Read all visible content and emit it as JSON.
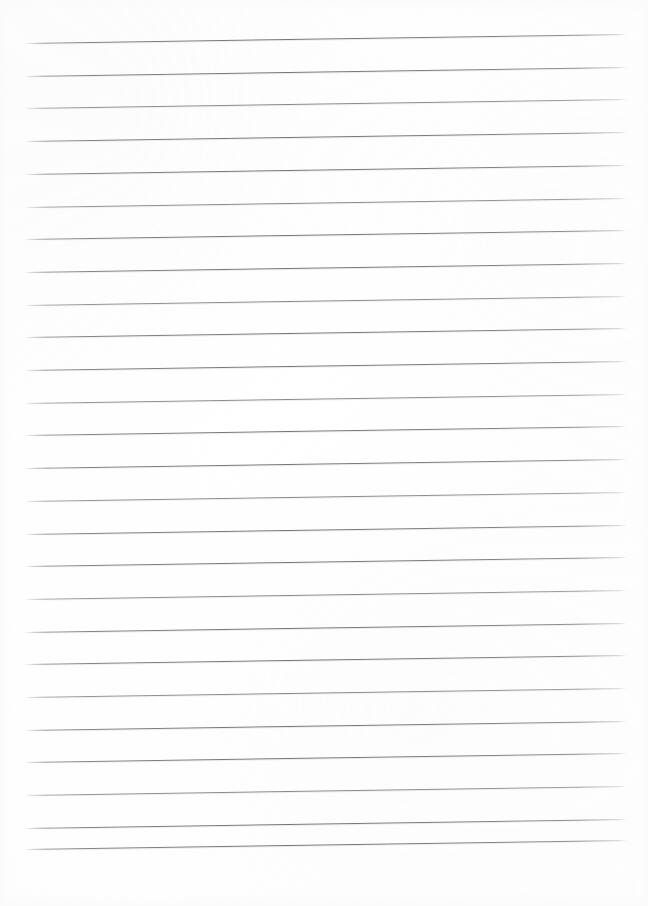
{
  "document": {
    "kind": "scanned-lined-paper",
    "title": "Blank lined notepad page",
    "description": "A scanned blank sheet of ruled notepad paper with no handwriting or printed text.",
    "visible_text": "",
    "page_width": 648,
    "page_height": 906
  },
  "paper": {
    "background_color": "#fefefe",
    "edge_tint_color": "#fafafa",
    "has_margin_rule": false,
    "has_holes": false,
    "has_header": false,
    "orientation": "portrait"
  },
  "ruling": {
    "line_color": "#74747a",
    "line_shadow_color": "#c8c8ce",
    "line_count": 26,
    "line_thickness_px": 1,
    "line_spacing_px": 32.7,
    "left_start_x": 25,
    "right_end_x": 627,
    "line_length_px": 602,
    "first_line_left_y": 43,
    "last_line_left_y": 848,
    "skew_degrees": -0.86,
    "skew_rise_px": 9,
    "lines": [
      {
        "index": 1,
        "left_y": 43.0,
        "right_y": 34.0,
        "weight": "strong"
      },
      {
        "index": 2,
        "left_y": 75.7,
        "right_y": 66.7,
        "weight": "strong"
      },
      {
        "index": 3,
        "left_y": 108.4,
        "right_y": 99.4,
        "weight": "faint"
      },
      {
        "index": 4,
        "left_y": 141.1,
        "right_y": 132.1,
        "weight": "strong"
      },
      {
        "index": 5,
        "left_y": 173.8,
        "right_y": 164.8,
        "weight": "strong"
      },
      {
        "index": 6,
        "left_y": 206.5,
        "right_y": 197.5,
        "weight": "faint"
      },
      {
        "index": 7,
        "left_y": 239.2,
        "right_y": 230.2,
        "weight": "strong"
      },
      {
        "index": 8,
        "left_y": 271.9,
        "right_y": 262.9,
        "weight": "strong"
      },
      {
        "index": 9,
        "left_y": 304.6,
        "right_y": 295.6,
        "weight": "faint"
      },
      {
        "index": 10,
        "left_y": 337.3,
        "right_y": 328.3,
        "weight": "strong"
      },
      {
        "index": 11,
        "left_y": 370.0,
        "right_y": 361.0,
        "weight": "strong"
      },
      {
        "index": 12,
        "left_y": 402.7,
        "right_y": 393.7,
        "weight": "faint"
      },
      {
        "index": 13,
        "left_y": 435.4,
        "right_y": 426.4,
        "weight": "strong"
      },
      {
        "index": 14,
        "left_y": 468.1,
        "right_y": 459.1,
        "weight": "strong"
      },
      {
        "index": 15,
        "left_y": 500.8,
        "right_y": 491.8,
        "weight": "faint"
      },
      {
        "index": 16,
        "left_y": 533.5,
        "right_y": 524.5,
        "weight": "strong"
      },
      {
        "index": 17,
        "left_y": 566.2,
        "right_y": 557.2,
        "weight": "strong"
      },
      {
        "index": 18,
        "left_y": 598.9,
        "right_y": 589.9,
        "weight": "faint"
      },
      {
        "index": 19,
        "left_y": 631.6,
        "right_y": 622.6,
        "weight": "strong"
      },
      {
        "index": 20,
        "left_y": 664.3,
        "right_y": 655.3,
        "weight": "strong"
      },
      {
        "index": 21,
        "left_y": 697.0,
        "right_y": 688.0,
        "weight": "faint"
      },
      {
        "index": 22,
        "left_y": 729.7,
        "right_y": 720.7,
        "weight": "strong"
      },
      {
        "index": 23,
        "left_y": 762.4,
        "right_y": 753.4,
        "weight": "strong"
      },
      {
        "index": 24,
        "left_y": 795.1,
        "right_y": 786.1,
        "weight": "faint"
      },
      {
        "index": 25,
        "left_y": 827.8,
        "right_y": 818.8,
        "weight": "strong"
      },
      {
        "index": 26,
        "left_y": 848.5,
        "right_y": 839.5,
        "weight": "strong"
      }
    ]
  },
  "margins": {
    "top_px": 43,
    "bottom_px": 58,
    "left_px": 25,
    "right_px": 21
  }
}
